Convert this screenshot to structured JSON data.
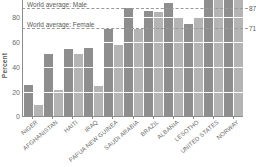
{
  "chart_data": {
    "type": "bar",
    "title": "",
    "xlabel": "",
    "ylabel": "Percent",
    "ylim": [
      0,
      100
    ],
    "ytick_labels": [
      "0",
      "20",
      "40",
      "60",
      "80"
    ],
    "yticks": [
      0,
      20,
      40,
      60,
      80
    ],
    "grid": true,
    "legend_position": "none",
    "categories": [
      "NIGER",
      "AFGHANISTAN",
      "HAITI",
      "IRAQ",
      "PAPUA NEW GUINEA",
      "SAUDI ARABIA",
      "BRAZIL",
      "ALBANIA",
      "LESOTHO",
      "UNITED STATES",
      "NORWAY"
    ],
    "series": [
      {
        "name": "Male",
        "color": "#8e8e8e",
        "values": [
          25,
          50,
          54,
          55,
          70,
          87,
          85,
          91,
          74,
          98,
          100
        ]
      },
      {
        "name": "Female",
        "color": "#b4b4b4",
        "values": [
          9,
          21,
          50,
          24,
          57,
          70,
          84,
          79,
          80,
          97,
          100
        ]
      }
    ],
    "annotations": [
      {
        "label": "World average: Male",
        "value": 87,
        "value_label": "87",
        "style": "dashed"
      },
      {
        "label": "World average: Female",
        "value": 71,
        "value_label": "71",
        "style": "dashed"
      }
    ]
  }
}
